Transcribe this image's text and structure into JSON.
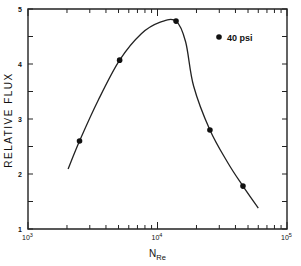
{
  "chart_data": {
    "type": "line",
    "title": "",
    "xlabel": "N_Re",
    "xlabel_main": "N",
    "xlabel_sub": "Re",
    "ylabel": "RELATIVE FLUX",
    "xscale": "log",
    "xlim": [
      1000,
      100000
    ],
    "ylim": [
      1,
      5
    ],
    "x_ticks": [
      {
        "base": "10",
        "exp": "3"
      },
      {
        "base": "10",
        "exp": "4"
      },
      {
        "base": "10",
        "exp": "5"
      }
    ],
    "y_ticks": [
      "1",
      "2",
      "3",
      "4",
      "5"
    ],
    "grid": false,
    "legend": {
      "position": "upper right",
      "entries": [
        {
          "marker": "circle",
          "label": "40 psi"
        }
      ]
    },
    "series": [
      {
        "name": "40 psi",
        "points": [
          {
            "x": 2500,
            "y": 2.6
          },
          {
            "x": 5100,
            "y": 4.07
          },
          {
            "x": 13900,
            "y": 4.78
          },
          {
            "x": 25400,
            "y": 2.8
          },
          {
            "x": 45700,
            "y": 1.78
          }
        ],
        "fitted_curve": [
          {
            "x": 2040,
            "y": 2.09
          },
          {
            "x": 2500,
            "y": 2.6
          },
          {
            "x": 3500,
            "y": 3.35
          },
          {
            "x": 5100,
            "y": 4.07
          },
          {
            "x": 7500,
            "y": 4.55
          },
          {
            "x": 10500,
            "y": 4.76
          },
          {
            "x": 13900,
            "y": 4.78
          },
          {
            "x": 16500,
            "y": 4.4
          },
          {
            "x": 19000,
            "y": 3.6
          },
          {
            "x": 25400,
            "y": 2.8
          },
          {
            "x": 35000,
            "y": 2.2
          },
          {
            "x": 45700,
            "y": 1.78
          },
          {
            "x": 60000,
            "y": 1.38
          }
        ]
      }
    ]
  }
}
